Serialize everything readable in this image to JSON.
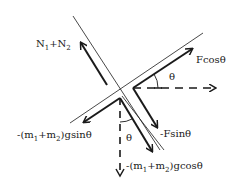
{
  "labels": {
    "normal": {
      "base": "N",
      "sub1": "1",
      "plus": "+N",
      "sub2": "2"
    },
    "fcos": "Fcosθ",
    "fsin": "-Fsinθ",
    "theta_top": "θ",
    "theta_bottom": "θ",
    "gsin": {
      "pre": "-(m",
      "sub1": "1",
      "mid": "+m",
      "sub2": "2",
      "post": ")gsinθ"
    },
    "gcos": {
      "pre": "-(m",
      "sub1": "1",
      "mid": "+m",
      "sub2": "2",
      "post": ")gcosθ"
    }
  },
  "colors": {
    "ink": "#1a1a1a",
    "background": "#ffffff"
  }
}
